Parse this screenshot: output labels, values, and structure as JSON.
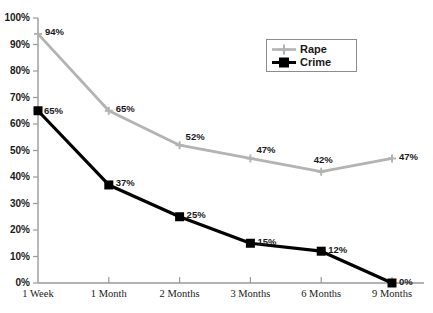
{
  "chart_data": {
    "type": "line",
    "title": "",
    "subtitle": "",
    "xlabel": "",
    "ylabel": "",
    "categories": [
      "1 Week",
      "1 Month",
      "2 Months",
      "3 Months",
      "6 Months",
      "9 Months"
    ],
    "ylim": [
      0,
      100
    ],
    "ytick_labels": [
      "0%",
      "10%",
      "20%",
      "30%",
      "40%",
      "50%",
      "60%",
      "70%",
      "80%",
      "90%",
      "100%"
    ],
    "ytick_values": [
      0,
      10,
      20,
      30,
      40,
      50,
      60,
      70,
      80,
      90,
      100
    ],
    "grid": false,
    "legend_position": "upper-right",
    "series": [
      {
        "name": "Rape",
        "color": "#b3b3b3",
        "marker": "plus-diamond",
        "values": [
          94,
          65,
          52,
          47,
          42,
          47
        ],
        "point_labels": [
          "94%",
          "65%",
          "52%",
          "47%",
          "42%",
          "47%"
        ]
      },
      {
        "name": "Crime",
        "color": "#000000",
        "marker": "square",
        "values": [
          65,
          37,
          25,
          15,
          12,
          0
        ],
        "point_labels": [
          "65%",
          "37%",
          "25%",
          "15%",
          "12%",
          "0%"
        ]
      }
    ]
  },
  "legend": {
    "items": [
      {
        "label": "Rape"
      },
      {
        "label": "Crime"
      }
    ]
  },
  "axis": {
    "color": "#9a9a9a"
  }
}
